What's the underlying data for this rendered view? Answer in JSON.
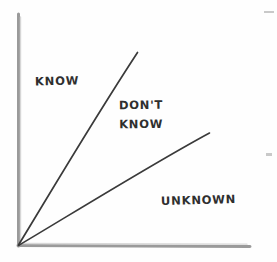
{
  "diagram": {
    "style": "hand-drawn sketch on white paper",
    "background_color": "#fefefe",
    "axis_color": "#9a9a9a",
    "line_color": "#3a3a3a",
    "text_color": "#2f2f2f",
    "axes": {
      "origin": {
        "x": 18,
        "y": 245
      },
      "y_axis": {
        "name": "vertical-axis",
        "x1": 18,
        "y1": 245,
        "x2": 18,
        "y2": 14
      },
      "x_axis": {
        "name": "horizontal-axis",
        "x1": 18,
        "y1": 245,
        "x2": 250,
        "y2": 246
      }
    },
    "rays": [
      {
        "name": "steep-ray",
        "x1": 18,
        "y1": 245,
        "x2": 137,
        "y2": 52
      },
      {
        "name": "shallow-ray",
        "x1": 18,
        "y1": 245,
        "x2": 209,
        "y2": 133
      }
    ],
    "labels": {
      "know": "KNOW",
      "dont_know_line1": "DON'T",
      "dont_know_line2": "KNOW",
      "unknown": "UNKNOWN"
    }
  }
}
